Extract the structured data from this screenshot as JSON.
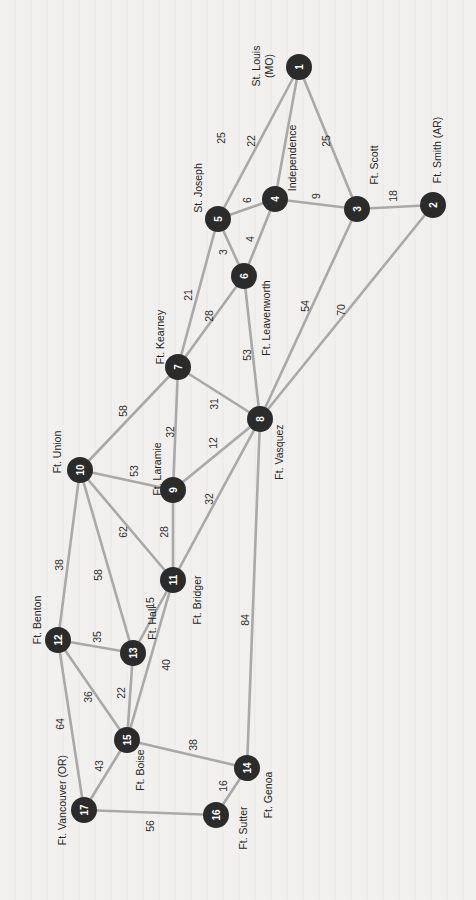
{
  "diagram": {
    "orientation": "rotated 90 degrees counter-clockwise",
    "colors": {
      "background": "#f1f0ee",
      "node": "#2b2b2b",
      "node_text": "#ffffff",
      "edge": "#a9a9a9",
      "label": "#262626"
    },
    "nodes": [
      {
        "id": 1,
        "label": "St. Louis (MO)",
        "label_lines": [
          "St. Louis",
          "(MO)"
        ],
        "x": 299,
        "y": 67,
        "lx": 262,
        "ly": 66
      },
      {
        "id": 2,
        "label": "Ft. Smith (AR)",
        "label_lines": [
          "Ft. Smith (AR)"
        ],
        "x": 433,
        "y": 205,
        "lx": 437,
        "ly": 150
      },
      {
        "id": 3,
        "label": "Ft. Scott",
        "label_lines": [
          "Ft. Scott"
        ],
        "x": 357,
        "y": 209,
        "lx": 374,
        "ly": 165
      },
      {
        "id": 4,
        "label": "Independence",
        "label_lines": [
          "Independence"
        ],
        "x": 275,
        "y": 199,
        "lx": 292,
        "ly": 158
      },
      {
        "id": 5,
        "label": "St. Joseph",
        "label_lines": [
          "St. Joseph"
        ],
        "x": 218,
        "y": 219,
        "lx": 198,
        "ly": 188
      },
      {
        "id": 6,
        "label": "Ft. Leavenworth",
        "label_lines": [
          "Ft. Leavenworth"
        ],
        "x": 244,
        "y": 276,
        "lx": 266,
        "ly": 318
      },
      {
        "id": 7,
        "label": "Ft. Kearney",
        "label_lines": [
          "Ft. Kearney"
        ],
        "x": 178,
        "y": 367,
        "lx": 160,
        "ly": 337
      },
      {
        "id": 8,
        "label": "Ft. Vasquez",
        "label_lines": [
          "Ft. Vasquez"
        ],
        "x": 260,
        "y": 419,
        "lx": 279,
        "ly": 452
      },
      {
        "id": 9,
        "label": "Ft. Laramie",
        "label_lines": [
          "Ft. Laramie"
        ],
        "x": 173,
        "y": 490,
        "lx": 157,
        "ly": 469
      },
      {
        "id": 10,
        "label": "Ft. Union",
        "label_lines": [
          "Ft. Union"
        ],
        "x": 80,
        "y": 470,
        "lx": 57,
        "ly": 452
      },
      {
        "id": 11,
        "label": "Ft. Bridger",
        "label_lines": [
          "Ft. Bridger"
        ],
        "x": 173,
        "y": 580,
        "lx": 197,
        "ly": 600
      },
      {
        "id": 12,
        "label": "Ft. Benton",
        "label_lines": [
          "Ft. Benton"
        ],
        "x": 58,
        "y": 640,
        "lx": 37,
        "ly": 620
      },
      {
        "id": 13,
        "label": "Ft. Hall",
        "label_lines": [
          "Ft. Hall"
        ],
        "x": 133,
        "y": 653,
        "lx": 152,
        "ly": 623
      },
      {
        "id": 14,
        "label": "Ft. Genoa",
        "label_lines": [
          "Ft. Genoa"
        ],
        "x": 247,
        "y": 768,
        "lx": 268,
        "ly": 795
      },
      {
        "id": 15,
        "label": "Ft. Boise",
        "label_lines": [
          "Ft. Boise"
        ],
        "x": 127,
        "y": 740,
        "lx": 140,
        "ly": 770
      },
      {
        "id": 16,
        "label": "Ft. Sutter",
        "label_lines": [
          "Ft. Sutter"
        ],
        "x": 216,
        "y": 815,
        "lx": 243,
        "ly": 828
      },
      {
        "id": 17,
        "label": "Ft. Vancouver (OR)",
        "label_lines": [
          "Ft. Vancouver (OR)"
        ],
        "x": 84,
        "y": 810,
        "lx": 62,
        "ly": 800
      }
    ],
    "edges": [
      {
        "from": 1,
        "to": 5,
        "weight": 25,
        "wx": 221,
        "wy": 138
      },
      {
        "from": 1,
        "to": 4,
        "weight": 22,
        "wx": 251,
        "wy": 141
      },
      {
        "from": 1,
        "to": 3,
        "weight": 25,
        "wx": 326,
        "wy": 141
      },
      {
        "from": 5,
        "to": 4,
        "weight": 6,
        "wx": 247,
        "wy": 200
      },
      {
        "from": 4,
        "to": 3,
        "weight": 9,
        "wx": 316,
        "wy": 196
      },
      {
        "from": 3,
        "to": 2,
        "weight": 18,
        "wx": 393,
        "wy": 196
      },
      {
        "from": 5,
        "to": 6,
        "weight": 3,
        "wx": 223,
        "wy": 252
      },
      {
        "from": 4,
        "to": 6,
        "weight": 4,
        "wx": 250,
        "wy": 239
      },
      {
        "from": 5,
        "to": 7,
        "weight": 21,
        "wx": 188,
        "wy": 295
      },
      {
        "from": 6,
        "to": 7,
        "weight": 28,
        "wx": 209,
        "wy": 316
      },
      {
        "from": 6,
        "to": 8,
        "weight": 53,
        "wx": 247,
        "wy": 355
      },
      {
        "from": 3,
        "to": 8,
        "weight": 54,
        "wx": 305,
        "wy": 306
      },
      {
        "from": 2,
        "to": 8,
        "weight": 70,
        "wx": 341,
        "wy": 310
      },
      {
        "from": 7,
        "to": 8,
        "weight": 31,
        "wx": 214,
        "wy": 404
      },
      {
        "from": 7,
        "to": 10,
        "weight": 58,
        "wx": 123,
        "wy": 411
      },
      {
        "from": 7,
        "to": 9,
        "weight": 32,
        "wx": 170,
        "wy": 432
      },
      {
        "from": 8,
        "to": 9,
        "weight": 12,
        "wx": 213,
        "wy": 443
      },
      {
        "from": 10,
        "to": 9,
        "weight": 53,
        "wx": 134,
        "wy": 471
      },
      {
        "from": 9,
        "to": 11,
        "weight": 28,
        "wx": 164,
        "wy": 532
      },
      {
        "from": 8,
        "to": 11,
        "weight": 32,
        "wx": 209,
        "wy": 499
      },
      {
        "from": 10,
        "to": 11,
        "weight": 62,
        "wx": 123,
        "wy": 532
      },
      {
        "from": 10,
        "to": 12,
        "weight": 38,
        "wx": 59,
        "wy": 565
      },
      {
        "from": 10,
        "to": 13,
        "weight": 58,
        "wx": 98,
        "wy": 575
      },
      {
        "from": 11,
        "to": 13,
        "weight": 15,
        "wx": 150,
        "wy": 603
      },
      {
        "from": 12,
        "to": 13,
        "weight": 35,
        "wx": 97,
        "wy": 637
      },
      {
        "from": 11,
        "to": 15,
        "weight": 40,
        "wx": 166,
        "wy": 665
      },
      {
        "from": 8,
        "to": 14,
        "weight": 84,
        "wx": 245,
        "wy": 620
      },
      {
        "from": 12,
        "to": 15,
        "weight": 36,
        "wx": 88,
        "wy": 697
      },
      {
        "from": 13,
        "to": 15,
        "weight": 22,
        "wx": 121,
        "wy": 693
      },
      {
        "from": 12,
        "to": 17,
        "weight": 64,
        "wx": 60,
        "wy": 724
      },
      {
        "from": 15,
        "to": 14,
        "weight": 38,
        "wx": 193,
        "wy": 745
      },
      {
        "from": 15,
        "to": 17,
        "weight": 43,
        "wx": 99,
        "wy": 766
      },
      {
        "from": 14,
        "to": 16,
        "weight": 16,
        "wx": 223,
        "wy": 786
      },
      {
        "from": 17,
        "to": 16,
        "weight": 56,
        "wx": 150,
        "wy": 826
      }
    ]
  }
}
